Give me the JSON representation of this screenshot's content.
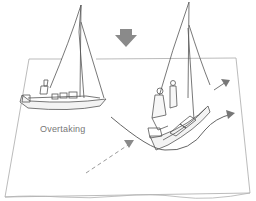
{
  "diagram": {
    "labels": {
      "overtaking": "Overtaking"
    },
    "colors": {
      "line": "#555555",
      "water_outline": "#aaaaaa",
      "wind_arrow": "#8a8a8a",
      "path": "#666666",
      "dashed_path": "#9a9a9a",
      "label": "#777777"
    },
    "icons": {
      "wind": "wind-arrow-icon",
      "boat_left": "sailboat-overtaken-icon",
      "boat_right": "sailboat-overtaking-icon"
    }
  }
}
